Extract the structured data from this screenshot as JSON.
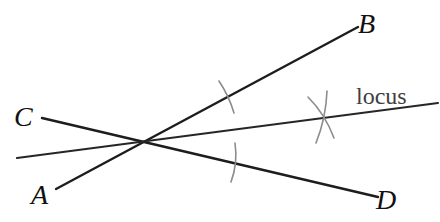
{
  "figure": {
    "type": "geometry-construction",
    "canvas": {
      "width": 440,
      "height": 222,
      "background": "#ffffff"
    },
    "colors": {
      "main_line": "#1d1d1d",
      "locus_line": "#262626",
      "construction_mark": "#8c8c8c",
      "label": "#111111",
      "locus_label": "#404040"
    },
    "lines": [
      {
        "id": "line-ab",
        "ends": "A to B",
        "x1": 56,
        "y1": 189,
        "x2": 358,
        "y2": 27,
        "stroke": "#1d1d1d",
        "width": 2.4
      },
      {
        "id": "line-cd",
        "ends": "C to D",
        "x1": 42,
        "y1": 118,
        "x2": 378,
        "y2": 197,
        "stroke": "#1d1d1d",
        "width": 2.4
      },
      {
        "id": "line-locus",
        "ends": "left edge to locus label",
        "x1": 17,
        "y1": 158,
        "x2": 438,
        "y2": 103,
        "stroke": "#262626",
        "width": 2.1
      }
    ],
    "intersection": {
      "x": 144,
      "y": 142
    },
    "construction_marks": [
      {
        "id": "tick-on-ray-b",
        "path": "M219 81 Q229 96 234 113",
        "stroke": "#8c8c8c",
        "width": 1.6
      },
      {
        "id": "tick-on-ray-d",
        "path": "M235 143 Q238 163 231 182",
        "stroke": "#8c8c8c",
        "width": 1.6
      },
      {
        "id": "cross-arc-from-b",
        "path": "M327 91 Q326 118 316 143",
        "stroke": "#8c8c8c",
        "width": 1.6
      },
      {
        "id": "cross-arc-from-d",
        "path": "M308 97 Q325 114 334 138",
        "stroke": "#8c8c8c",
        "width": 1.6
      }
    ],
    "labels": [
      {
        "id": "label-a",
        "text": "A",
        "x": 31,
        "y": 181,
        "style": "italic"
      },
      {
        "id": "label-b",
        "text": "B",
        "x": 358,
        "y": 10,
        "style": "italic"
      },
      {
        "id": "label-c",
        "text": "C",
        "x": 14,
        "y": 103,
        "style": "italic"
      },
      {
        "id": "label-d",
        "text": "D",
        "x": 376,
        "y": 186,
        "style": "italic"
      },
      {
        "id": "label-locus",
        "text": "locus",
        "x": 356,
        "y": 84,
        "style": "normal"
      }
    ]
  }
}
